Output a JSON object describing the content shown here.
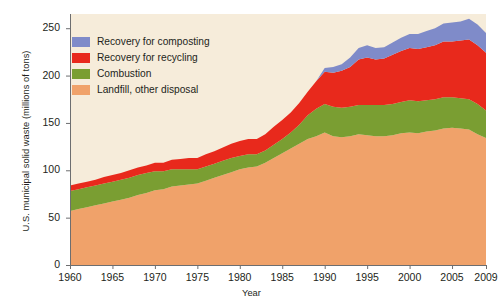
{
  "chart_data": {
    "type": "area",
    "stacked": true,
    "title": "",
    "subtitle": "",
    "xlabel": "Year",
    "ylabel": "U.S. municipal solid waste (millions of tons)",
    "xlim": [
      1960,
      2009
    ],
    "ylim": [
      0,
      265
    ],
    "grid": false,
    "legend_position": "upper-left-inside",
    "x": [
      1960,
      1961,
      1962,
      1963,
      1964,
      1965,
      1966,
      1967,
      1968,
      1969,
      1970,
      1971,
      1972,
      1973,
      1974,
      1975,
      1976,
      1977,
      1978,
      1979,
      1980,
      1981,
      1982,
      1983,
      1984,
      1985,
      1986,
      1987,
      1988,
      1989,
      1990,
      1991,
      1992,
      1993,
      1994,
      1995,
      1996,
      1997,
      1998,
      1999,
      2000,
      2001,
      2002,
      2003,
      2004,
      2005,
      2006,
      2007,
      2008,
      2009
    ],
    "series": [
      {
        "name": "Landfill, other disposal",
        "color": "#f0a26a",
        "values": [
          57,
          59,
          61,
          63,
          65,
          67,
          69,
          71,
          74,
          76,
          79,
          80,
          83,
          84,
          85,
          86,
          89,
          92,
          95,
          98,
          101,
          103,
          104,
          108,
          113,
          118,
          123,
          128,
          133,
          136,
          140,
          136,
          135,
          136,
          138,
          137,
          136,
          136,
          137,
          139,
          140,
          139,
          141,
          142,
          144,
          145,
          144,
          143,
          138,
          134
        ]
      },
      {
        "name": "Combustion",
        "color": "#7a9e32",
        "values": [
          21,
          21,
          21,
          21,
          21,
          21,
          21,
          21,
          21,
          21,
          20,
          19,
          18,
          17,
          16,
          15,
          15,
          15,
          15,
          15,
          14,
          14,
          13,
          13,
          14,
          15,
          17,
          20,
          25,
          29,
          30,
          31,
          31,
          31,
          31,
          32,
          33,
          33,
          33,
          33,
          34,
          34,
          33,
          33,
          33,
          32,
          32,
          32,
          32,
          29
        ]
      },
      {
        "name": "Recovery for recycling",
        "color": "#e8291c",
        "values": [
          6,
          6,
          6,
          6,
          7,
          7,
          7,
          8,
          8,
          8,
          9,
          9,
          10,
          11,
          12,
          12,
          13,
          13,
          14,
          15,
          16,
          16,
          16,
          17,
          19,
          20,
          21,
          23,
          25,
          29,
          34,
          36,
          39,
          42,
          48,
          50,
          48,
          49,
          52,
          54,
          55,
          55,
          56,
          57,
          59,
          59,
          61,
          63,
          62,
          61
        ]
      },
      {
        "name": "Recovery for composting",
        "color": "#7f8bc9",
        "values": [
          0,
          0,
          0,
          0,
          0,
          0,
          0,
          0,
          0,
          0,
          0,
          0,
          0,
          0,
          0,
          0,
          0,
          0,
          0,
          0,
          0,
          0,
          0,
          0,
          0,
          0,
          0,
          0,
          0,
          0,
          4,
          6,
          7,
          10,
          12,
          13,
          12,
          12,
          13,
          14,
          15,
          16,
          17,
          18,
          19,
          20,
          20,
          22,
          22,
          21
        ]
      }
    ],
    "yticks": [
      0,
      50,
      100,
      150,
      200,
      250
    ],
    "ytick_labels": [
      "0",
      "50",
      "100",
      "150",
      "200",
      "250"
    ],
    "xticks": [
      1960,
      1965,
      1970,
      1975,
      1980,
      1985,
      1990,
      1995,
      2000,
      2005,
      2009
    ],
    "xtick_labels": [
      "1960",
      "1965",
      "1970",
      "1975",
      "1980",
      "1985",
      "1990",
      "1995",
      "2000",
      "2005",
      "2009"
    ],
    "legend": [
      {
        "label": "Recovery for composting",
        "color": "#7f8bc9"
      },
      {
        "label": "Recovery for recycling",
        "color": "#e8291c"
      },
      {
        "label": "Combustion",
        "color": "#7a9e32"
      },
      {
        "label": "Landfill, other disposal",
        "color": "#f0a26a"
      }
    ],
    "plot_background": "#f6ecda",
    "figure_background": "#ffffff",
    "axis_color": "#6d6e70"
  }
}
